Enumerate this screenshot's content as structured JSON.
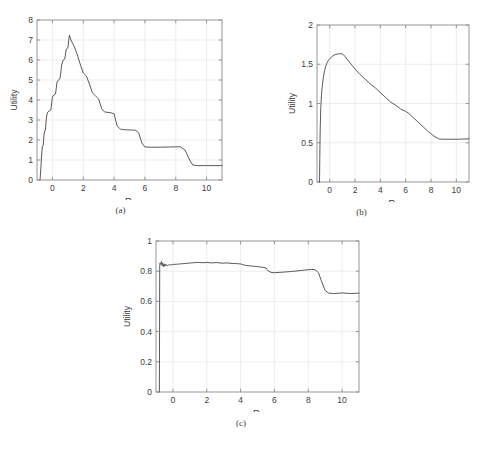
{
  "figure": {
    "title": "",
    "panels": [
      {
        "id": "a",
        "caption": "(a)",
        "chart_data": {
          "type": "line",
          "title": "",
          "xlabel": "R_v",
          "xlabel_base": "R",
          "xlabel_sub": "v",
          "ylabel": "Utility",
          "xlim": [
            -1,
            11
          ],
          "ylim": [
            0,
            8
          ],
          "xticks": [
            0,
            2,
            4,
            6,
            8,
            10
          ],
          "xticklabels": [
            "0",
            "2",
            "4",
            "6",
            "8",
            "10"
          ],
          "yticks": [
            0,
            1,
            2,
            3,
            4,
            5,
            6,
            7,
            8
          ],
          "yticklabels": [
            "0",
            "1",
            "2",
            "3",
            "4",
            "5",
            "6",
            "7",
            "8"
          ],
          "grid": true,
          "legend": "none",
          "line_color": "#5a5a5a",
          "series": [
            {
              "name": "Utility",
              "x": [
                -0.8,
                -0.75,
                -0.7,
                -0.65,
                -0.6,
                -0.55,
                -0.5,
                -0.45,
                -0.4,
                -0.35,
                -0.3,
                -0.2,
                -0.1,
                0.0,
                0.1,
                0.2,
                0.3,
                0.4,
                0.5,
                0.6,
                0.7,
                0.8,
                0.9,
                1.0,
                1.1,
                1.2,
                1.3,
                1.4,
                1.6,
                1.8,
                2.0,
                2.2,
                2.4,
                2.6,
                2.8,
                3.0,
                3.2,
                3.4,
                3.6,
                3.8,
                4.0,
                4.2,
                4.4,
                4.6,
                4.8,
                5.0,
                5.2,
                5.4,
                5.6,
                5.8,
                6.0,
                6.4,
                7.0,
                7.6,
                8.0,
                8.3,
                8.6,
                8.9,
                9.1,
                9.4,
                10.0,
                10.6,
                11.0
              ],
              "y": [
                0.02,
                0.6,
                1.25,
                1.7,
                1.72,
                2.25,
                2.45,
                2.5,
                3.05,
                3.3,
                3.4,
                3.45,
                3.5,
                4.15,
                4.25,
                4.3,
                4.9,
                5.0,
                5.1,
                5.75,
                6.0,
                6.05,
                6.55,
                6.6,
                7.25,
                7.0,
                6.85,
                6.7,
                6.3,
                5.8,
                5.35,
                5.2,
                4.8,
                4.35,
                4.2,
                4.05,
                3.55,
                3.4,
                3.38,
                3.36,
                3.3,
                2.7,
                2.55,
                2.52,
                2.51,
                2.5,
                2.5,
                2.48,
                2.35,
                1.85,
                1.65,
                1.64,
                1.64,
                1.65,
                1.66,
                1.66,
                1.5,
                1.0,
                0.75,
                0.72,
                0.72,
                0.72,
                0.72
              ]
            }
          ]
        }
      },
      {
        "id": "b",
        "caption": "(b)",
        "chart_data": {
          "type": "line",
          "title": "",
          "xlabel": "R_v",
          "xlabel_base": "R",
          "xlabel_sub": "v",
          "ylabel": "Utility",
          "xlim": [
            -1,
            11
          ],
          "ylim": [
            0,
            2
          ],
          "xticks": [
            0,
            2,
            4,
            6,
            8,
            10
          ],
          "xticklabels": [
            "0",
            "2",
            "4",
            "6",
            "8",
            "10"
          ],
          "yticks": [
            0,
            0.5,
            1,
            1.5,
            2
          ],
          "yticklabels": [
            "0",
            "0.5",
            "1",
            "1.5",
            "2"
          ],
          "grid": true,
          "legend": "none",
          "line_color": "#5a5a5a",
          "series": [
            {
              "name": "Utility",
              "x": [
                -0.8,
                -0.78,
                -0.75,
                -0.7,
                -0.65,
                -0.6,
                -0.5,
                -0.4,
                -0.3,
                -0.2,
                -0.1,
                0.0,
                0.2,
                0.4,
                0.6,
                0.8,
                1.0,
                1.1,
                1.2,
                1.4,
                1.6,
                1.8,
                2.0,
                2.4,
                2.8,
                3.2,
                3.6,
                4.0,
                4.4,
                4.8,
                5.2,
                5.6,
                6.0,
                6.2,
                6.6,
                7.0,
                7.4,
                7.8,
                8.2,
                8.6,
                8.9,
                9.2,
                9.6,
                10.2,
                10.6,
                11.0
              ],
              "y": [
                0.0,
                0.3,
                0.65,
                0.95,
                1.1,
                1.2,
                1.33,
                1.42,
                1.48,
                1.52,
                1.55,
                1.57,
                1.6,
                1.62,
                1.63,
                1.635,
                1.63,
                1.62,
                1.6,
                1.56,
                1.52,
                1.48,
                1.44,
                1.37,
                1.31,
                1.25,
                1.2,
                1.14,
                1.08,
                1.02,
                0.98,
                0.93,
                0.9,
                0.88,
                0.82,
                0.76,
                0.7,
                0.64,
                0.59,
                0.55,
                0.545,
                0.545,
                0.545,
                0.545,
                0.548,
                0.55
              ]
            }
          ]
        }
      },
      {
        "id": "c",
        "caption": "(c)",
        "chart_data": {
          "type": "line",
          "title": "",
          "xlabel": "R_v",
          "xlabel_base": "R",
          "xlabel_sub": "v",
          "ylabel": "Utility",
          "xlim": [
            -1,
            11
          ],
          "ylim": [
            0,
            1
          ],
          "xticks": [
            0,
            2,
            4,
            6,
            8,
            10
          ],
          "xticklabels": [
            "0",
            "2",
            "4",
            "6",
            "8",
            "10"
          ],
          "yticks": [
            0,
            0.2,
            0.4,
            0.6,
            0.8,
            1
          ],
          "yticklabels": [
            "0",
            "0.2",
            "0.4",
            "0.6",
            "0.8",
            "1"
          ],
          "grid": true,
          "legend": "none",
          "line_color": "#5a5a5a",
          "series": [
            {
              "name": "Utility",
              "x": [
                -0.8,
                -0.79,
                -0.78,
                -0.76,
                -0.72,
                -0.68,
                -0.64,
                -0.6,
                -0.56,
                -0.52,
                -0.48,
                -0.44,
                -0.4,
                -0.36,
                -0.32,
                -0.28,
                -0.24,
                -0.2,
                -0.1,
                0.0,
                0.2,
                0.4,
                0.6,
                0.8,
                1.0,
                1.2,
                1.5,
                1.8,
                2.0,
                2.3,
                2.6,
                2.9,
                3.2,
                3.5,
                3.8,
                4.0,
                4.1,
                4.3,
                4.6,
                5.0,
                5.3,
                5.5,
                5.6,
                5.8,
                6.0,
                6.4,
                7.0,
                7.6,
                8.0,
                8.2,
                8.4,
                8.6,
                8.8,
                9.0,
                9.2,
                9.5,
                10.0,
                10.5,
                11.0
              ],
              "y": [
                0.0,
                0.4,
                0.84,
                0.855,
                0.845,
                0.865,
                0.835,
                0.855,
                0.83,
                0.848,
                0.832,
                0.845,
                0.836,
                0.843,
                0.838,
                0.842,
                0.84,
                0.843,
                0.841,
                0.845,
                0.846,
                0.848,
                0.85,
                0.852,
                0.854,
                0.856,
                0.858,
                0.856,
                0.858,
                0.855,
                0.857,
                0.853,
                0.855,
                0.851,
                0.85,
                0.848,
                0.845,
                0.838,
                0.835,
                0.83,
                0.826,
                0.822,
                0.805,
                0.792,
                0.79,
                0.793,
                0.798,
                0.805,
                0.81,
                0.812,
                0.81,
                0.79,
                0.73,
                0.672,
                0.655,
                0.652,
                0.656,
                0.652,
                0.655
              ]
            }
          ]
        }
      }
    ]
  }
}
